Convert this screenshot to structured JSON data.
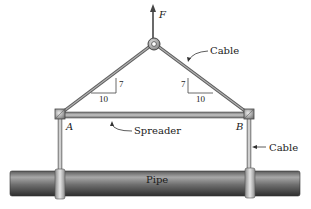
{
  "diagram": {
    "type": "statics-free-body",
    "labels": {
      "force": "F",
      "cable_top": "Cable",
      "cable_side": "Cable",
      "spreader": "Spreader",
      "pipe": "Pipe",
      "node_a": "A",
      "node_b": "B"
    },
    "slopes": {
      "left": {
        "rise": "7",
        "run": "10"
      },
      "right": {
        "rise": "7",
        "run": "10"
      }
    },
    "colors": {
      "member": "#8a8a8a",
      "member_dark": "#555555",
      "pipe_light": "#9a9a9a",
      "pipe_dark": "#3a3a3a",
      "background": "#ffffff"
    }
  }
}
